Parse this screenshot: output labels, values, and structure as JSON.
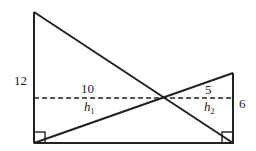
{
  "diagram": {
    "type": "geometry",
    "labels": {
      "left_height": "12",
      "right_height": "6",
      "left_segment": "10",
      "right_segment": "5",
      "h1_base": "h",
      "h1_sub": "1",
      "h2_base": "h",
      "h2_sub": "2"
    },
    "colors": {
      "stroke": "#222222",
      "background": "#ffffff"
    }
  }
}
